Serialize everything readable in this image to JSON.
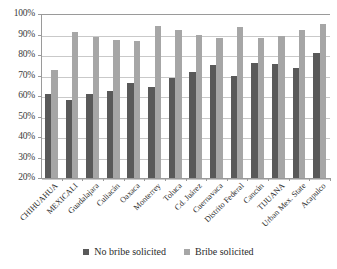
{
  "chart_data": {
    "type": "bar",
    "title": "",
    "subtitle": "",
    "xlabel": "",
    "ylabel": "",
    "ylim": [
      20,
      100
    ],
    "ytick_labels": [
      "100%",
      "90%",
      "80%",
      "70%",
      "60%",
      "50%",
      "40%",
      "30%",
      "20%"
    ],
    "ytick_values": [
      100,
      90,
      80,
      70,
      60,
      50,
      40,
      30,
      20
    ],
    "grid": true,
    "legend_position": "bottom",
    "categories": [
      "CHIHUAHUA",
      "MEXICALI",
      "Guadalajara",
      "Culiacán",
      "Oaxaca",
      "Monterrey",
      "Toluca",
      "Cd. Juárez",
      "Cuernavaca",
      "Distrito Federal",
      "Cancún",
      "TIJUANA",
      "Urban Mex. State",
      "Acapulco"
    ],
    "series": [
      {
        "name": "No bribe solicited",
        "color": "#595959",
        "values": [
          61,
          58,
          61,
          62.5,
          66.5,
          64.5,
          69,
          71.5,
          75,
          70,
          76,
          75.5,
          73.5,
          81
        ]
      },
      {
        "name": "Bribe solicited",
        "color": "#a6a6a6",
        "values": [
          72.5,
          91,
          89,
          87.5,
          87,
          94,
          92,
          90,
          88.5,
          93.5,
          88.5,
          89.5,
          92,
          95
        ]
      }
    ]
  },
  "legend": {
    "items": [
      {
        "label": "No bribe solicited",
        "color": "#595959"
      },
      {
        "label": "Bribe solicited",
        "color": "#a6a6a6"
      }
    ]
  }
}
